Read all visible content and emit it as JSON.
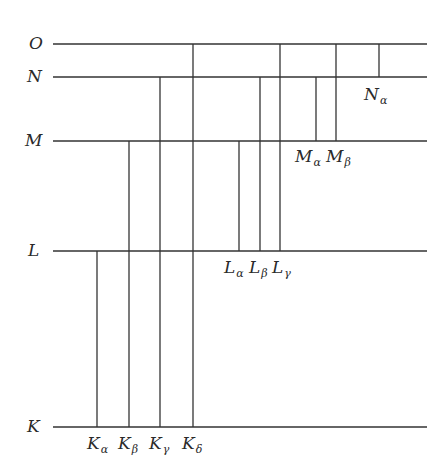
{
  "diagram": {
    "type": "energy-level-diagram",
    "line_color": "#333333",
    "levels": [
      {
        "name": "O",
        "y": 44
      },
      {
        "name": "N",
        "y": 77
      },
      {
        "name": "M",
        "y": 141
      },
      {
        "name": "L",
        "y": 251
      },
      {
        "name": "K",
        "y": 427
      }
    ],
    "level_x_start": 53,
    "level_x_end": 427,
    "transitions": [
      {
        "base": "K",
        "sub": "α",
        "x": 97,
        "from": "L",
        "to": "K"
      },
      {
        "base": "K",
        "sub": "β",
        "x": 129,
        "from": "M",
        "to": "K"
      },
      {
        "base": "K",
        "sub": "γ",
        "x": 160,
        "from": "N",
        "to": "K"
      },
      {
        "base": "K",
        "sub": "δ",
        "x": 193,
        "from": "O",
        "to": "K"
      },
      {
        "base": "L",
        "sub": "α",
        "x": 239,
        "from": "M",
        "to": "L"
      },
      {
        "base": "L",
        "sub": "β",
        "x": 260,
        "from": "N",
        "to": "L"
      },
      {
        "base": "L",
        "sub": "γ",
        "x": 280,
        "from": "O",
        "to": "L"
      },
      {
        "base": "M",
        "sub": "α",
        "x": 316,
        "from": "N",
        "to": "M"
      },
      {
        "base": "M",
        "sub": "β",
        "x": 336,
        "from": "O",
        "to": "M"
      },
      {
        "base": "N",
        "sub": "α",
        "x": 379,
        "from": "O",
        "to": "N"
      }
    ],
    "level_labels": {
      "O": "O",
      "N": "N",
      "M": "M",
      "L": "L",
      "K": "K"
    },
    "transition_labels": {
      "K_alpha": {
        "base": "K",
        "sub": "α"
      },
      "K_beta": {
        "base": "K",
        "sub": "β"
      },
      "K_gamma": {
        "base": "K",
        "sub": "γ"
      },
      "K_delta": {
        "base": "K",
        "sub": "δ"
      },
      "L_alpha": {
        "base": "L",
        "sub": "α"
      },
      "L_beta": {
        "base": "L",
        "sub": "β"
      },
      "L_gamma": {
        "base": "L",
        "sub": "γ"
      },
      "M_alpha": {
        "base": "M",
        "sub": "α"
      },
      "M_beta": {
        "base": "M",
        "sub": "β"
      },
      "N_alpha": {
        "base": "N",
        "sub": "α"
      }
    }
  }
}
